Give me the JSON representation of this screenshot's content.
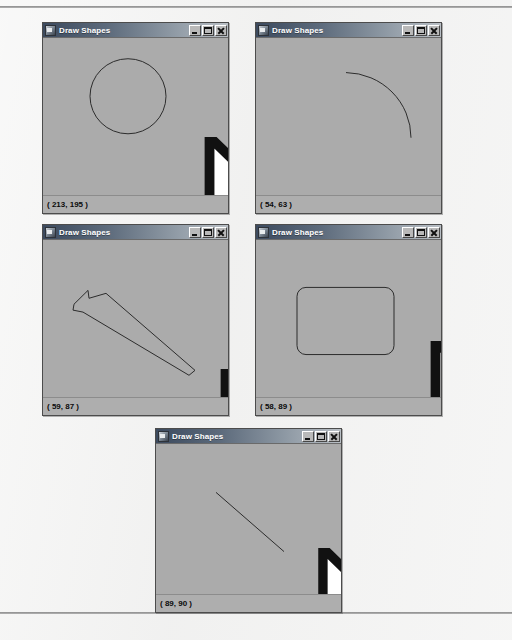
{
  "page": {
    "background_color": "#f1f1f0",
    "rule_color": "#8d8d8d"
  },
  "window_defaults": {
    "title": "Draw Shapes",
    "icon": "app-icon",
    "titlebar_start_color": "#3c4a5e",
    "titlebar_end_color": "#b9bfc5",
    "canvas_color": "#ababab",
    "stroke_color": "#2b2b2b",
    "controls": [
      {
        "name": "minimize",
        "label": "_"
      },
      {
        "name": "maximize",
        "label": "□"
      },
      {
        "name": "close",
        "label": "×"
      }
    ]
  },
  "windows": [
    {
      "id": "window-circle",
      "title": "Draw Shapes",
      "shape_kind": "circle",
      "status": "( 213, 195 )",
      "rect": {
        "left": 42,
        "top": 22,
        "width": 187,
        "height": 192
      },
      "cursor": {
        "x": 128,
        "y": 123
      }
    },
    {
      "id": "window-arc",
      "title": "Draw Shapes",
      "shape_kind": "arc",
      "status": "( 54, 63 )",
      "rect": {
        "left": 255,
        "top": 22,
        "width": 187,
        "height": 192
      },
      "cursor": {
        "x": 153,
        "y": 117
      }
    },
    {
      "id": "window-polygon",
      "title": "Draw Shapes",
      "shape_kind": "polygon",
      "status": "( 59, 87 )",
      "rect": {
        "left": 42,
        "top": 224,
        "width": 187,
        "height": 192
      },
      "cursor": {
        "x": 144,
        "y": 152
      }
    },
    {
      "id": "window-rounded-rect",
      "title": "Draw Shapes",
      "shape_kind": "rounded-rectangle",
      "status": "( 58, 89 )",
      "rect": {
        "left": 255,
        "top": 224,
        "width": 187,
        "height": 192
      },
      "cursor": {
        "x": 141,
        "y": 122
      }
    },
    {
      "id": "window-line",
      "title": "Draw Shapes",
      "shape_kind": "line",
      "status": "( 89, 90 )",
      "rect": {
        "left": 155,
        "top": 428,
        "width": 187,
        "height": 185
      },
      "cursor": {
        "x": 126,
        "y": 123
      }
    }
  ]
}
